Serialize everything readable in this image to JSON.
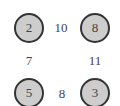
{
  "diagram": {
    "type": "graph",
    "nodes": [
      {
        "id": "top-left",
        "label": "2",
        "x": 29,
        "y": 28
      },
      {
        "id": "top-right",
        "label": "8",
        "x": 95,
        "y": 28
      },
      {
        "id": "bottom-left",
        "label": "5",
        "x": 29,
        "y": 93
      },
      {
        "id": "bottom-right",
        "label": "3",
        "x": 95,
        "y": 93
      }
    ],
    "edge_labels": [
      {
        "between": [
          "top-left",
          "top-right"
        ],
        "label": "10",
        "x": 61,
        "y": 27
      },
      {
        "between": [
          "top-left",
          "bottom-left"
        ],
        "label": "7",
        "x": 29,
        "y": 60
      },
      {
        "between": [
          "top-right",
          "bottom-right"
        ],
        "label": "11",
        "x": 95,
        "y": 60
      },
      {
        "between": [
          "bottom-left",
          "bottom-right"
        ],
        "label": "8",
        "x": 62,
        "y": 93
      }
    ],
    "colors": {
      "node_fill": "#cdcdcd",
      "node_border": "#333333",
      "text": "#444444"
    }
  }
}
